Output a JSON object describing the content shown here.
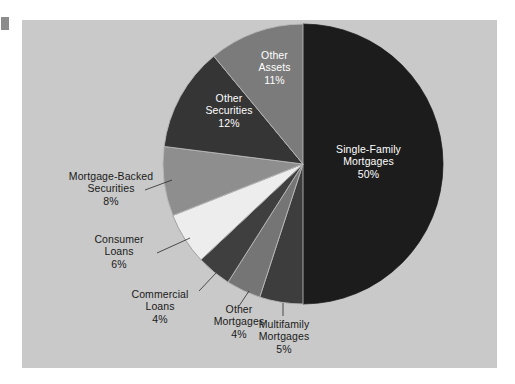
{
  "figure": {
    "panel_bg": "#c9c9c9",
    "page_bg": "#ffffff",
    "left_tab_color": "#8c8c8c",
    "label_color": "#1a1a1a",
    "inslice_label_color": "#ffffff"
  },
  "chart_data": {
    "type": "pie",
    "title": "",
    "subtitle": "",
    "xlabel": "",
    "ylabel": "",
    "grid": false,
    "legend_position": "none",
    "units": "percent",
    "total": 100,
    "start_angle_deg": 0,
    "direction": "clockwise",
    "center": {
      "x": 303,
      "y": 164
    },
    "radius": 140,
    "categories": [
      "Single-Family Mortgages",
      "Multifamily Mortgages",
      "Other Mortgages",
      "Commercial Loans",
      "Consumer Loans",
      "Mortgage-Backed Securities",
      "Other Securities",
      "Other Assets"
    ],
    "values": [
      50,
      5,
      4,
      4,
      6,
      8,
      12,
      11
    ],
    "slices": [
      {
        "label": "Single-Family Mortgages",
        "label_line_1": "Single-Family",
        "label_line_2": "Mortgages",
        "value": 50,
        "value_text": "50%",
        "color": "#1c1c1c",
        "label_placement": "inside"
      },
      {
        "label": "Multifamily Mortgages",
        "label_line_1": "Multifamily",
        "label_line_2": "Mortgages",
        "value": 5,
        "value_text": "5%",
        "color": "#3d3d3d",
        "label_placement": "outside"
      },
      {
        "label": "Other Mortgages",
        "label_line_1": "Other",
        "label_line_2": "Mortgages",
        "value": 4,
        "value_text": "4%",
        "color": "#757575",
        "label_placement": "outside"
      },
      {
        "label": "Commercial Loans",
        "label_line_1": "Commercial",
        "label_line_2": "Loans",
        "value": 4,
        "value_text": "4%",
        "color": "#3f3f3f",
        "label_placement": "outside"
      },
      {
        "label": "Consumer Loans",
        "label_line_1": "Consumer",
        "label_line_2": "Loans",
        "value": 6,
        "value_text": "6%",
        "color": "#ededed",
        "label_placement": "outside"
      },
      {
        "label": "Mortgage-Backed Securities",
        "label_line_1": "Mortgage-Backed",
        "label_line_2": "Securities",
        "value": 8,
        "value_text": "8%",
        "color": "#8e8e8e",
        "label_placement": "outside"
      },
      {
        "label": "Other Securities",
        "label_line_1": "Other",
        "label_line_2": "Securities",
        "value": 12,
        "value_text": "12%",
        "color": "#353535",
        "label_placement": "inside"
      },
      {
        "label": "Other Assets",
        "label_line_1": "Other",
        "label_line_2": "Assets",
        "value": 11,
        "value_text": "11%",
        "color": "#7b7b7b",
        "label_placement": "inside"
      }
    ]
  }
}
